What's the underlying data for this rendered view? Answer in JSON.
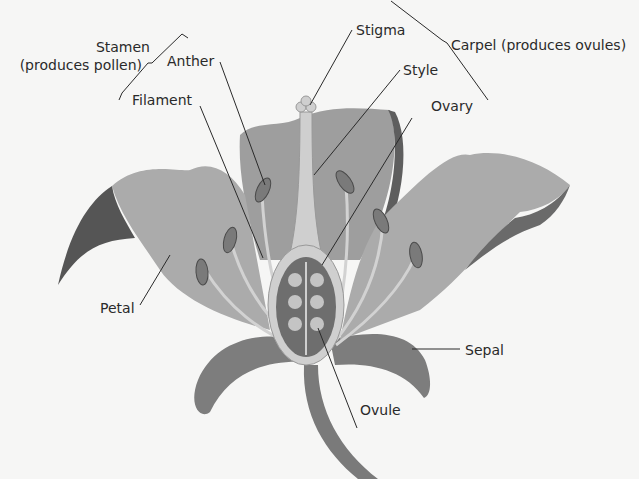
{
  "diagram": {
    "labels": {
      "stamen": "Stamen",
      "stamen_note": "(produces pollen)",
      "anther": "Anther",
      "filament": "Filament",
      "stigma": "Stigma",
      "style": "Style",
      "ovary": "Ovary",
      "carpel": "Carpel (produces ovules)",
      "petal": "Petal",
      "sepal": "Sepal",
      "ovule": "Ovule"
    },
    "colors": {
      "background": "#f6f6f5",
      "petal": "#a9a9a9",
      "petal_dark": "#5a5a5a",
      "sepal": "#7d7d7d",
      "carpel": "#cfcfcf",
      "ovary_inner": "#6e6e6e",
      "ovule": "#c4c4c4",
      "anther": "#7a7a7a",
      "text": "#2a2a2a"
    }
  }
}
